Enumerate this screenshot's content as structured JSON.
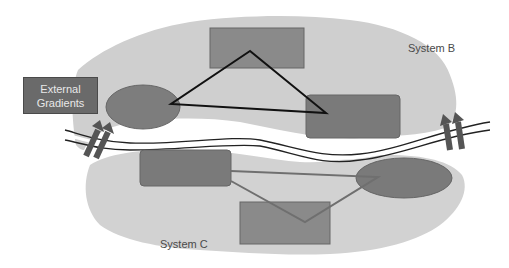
{
  "diagram": {
    "external_box": {
      "line1": "External",
      "line2": "Gradients"
    },
    "system_b": {
      "label": "System B"
    },
    "system_c": {
      "label": "System C"
    }
  },
  "colors": {
    "region": "#cfcfcf",
    "shape": "#8a8a8a",
    "shape_dark": "#787878",
    "triangle_stroke": "#111111",
    "link_stroke": "#6f6f6f",
    "arrow": "#555555"
  }
}
